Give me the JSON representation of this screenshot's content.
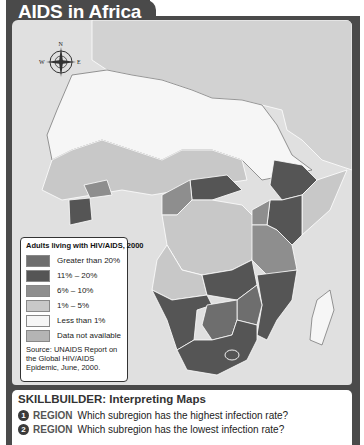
{
  "header": {
    "title": "AIDS in Africa"
  },
  "compass": {
    "icon": "compass-rose-icon",
    "labels": {
      "north": "N",
      "west": "W",
      "east": "E",
      "south": "S"
    }
  },
  "legend": {
    "title": "Adults living with HIV/AIDS, 2000",
    "items": [
      {
        "label": "Greater than 20%",
        "color": "#6e6e6e"
      },
      {
        "label": "11% – 20%",
        "color": "#555555"
      },
      {
        "label": "6% – 10%",
        "color": "#8e8e8e"
      },
      {
        "label": "1% – 5%",
        "color": "#c8c8c8"
      },
      {
        "label": "Less than 1%",
        "color": "#f6f6f6"
      },
      {
        "label": "Data not available",
        "color": "#b4b4b4"
      }
    ],
    "source": "Source:  UNAIDS Report on the Global HIV/AIDS Epidemic, June, 2000."
  },
  "skillbuilder": {
    "title": "SKILLBUILDER: Interpreting Maps",
    "questions": [
      {
        "number": "1",
        "tag": "REGION",
        "text": "Which subregion has the highest infection rate?"
      },
      {
        "number": "2",
        "tag": "REGION",
        "text": "Which subregion has the lowest infection rate?"
      }
    ]
  },
  "colors": {
    "frame": "#4a4a4a",
    "sea": "#e0e0e0",
    "land_other": "#d2d2d2",
    "low": "#f6f6f6",
    "band_1_5": "#c8c8c8",
    "band_6_10": "#8e8e8e",
    "band_11_20": "#555555",
    "band_gt20": "#6e6e6e"
  }
}
